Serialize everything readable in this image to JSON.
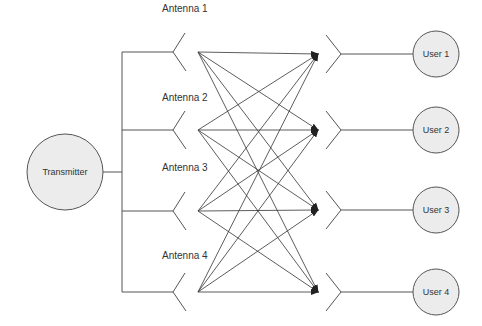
{
  "diagram": {
    "title": "",
    "transmitter": {
      "label": "Transmitter",
      "cx": 65,
      "cy": 172,
      "r": 38
    },
    "bus_x": 122,
    "antennas": [
      {
        "label": "Antenna 1",
        "y": 52,
        "label_y": 12
      },
      {
        "label": "Antenna 2",
        "y": 130,
        "label_y": 101
      },
      {
        "label": "Antenna 3",
        "y": 211,
        "label_y": 171
      },
      {
        "label": "Antenna 4",
        "y": 292,
        "label_y": 259
      }
    ],
    "users": [
      {
        "label": "User 1",
        "y": 54
      },
      {
        "label": "User 2",
        "y": 130
      },
      {
        "label": "User 3",
        "y": 210
      },
      {
        "label": "User 4",
        "y": 292
      }
    ],
    "links": "every antenna connects to every user (4x4 arrows)",
    "colors": {
      "line": "#555555",
      "node_fill": "#ececec",
      "text": "#333333"
    }
  }
}
